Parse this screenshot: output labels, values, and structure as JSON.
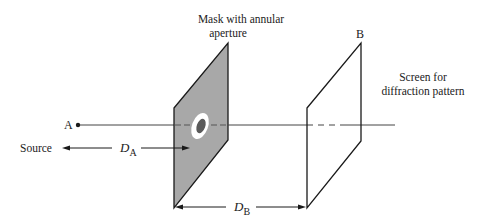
{
  "diagram": {
    "labels": {
      "mask_line1": "Mask with annular",
      "mask_line2": "aperture",
      "point_a": "A",
      "point_b": "B",
      "screen_line1": "Screen for",
      "screen_line2": "diffraction pattern",
      "source": "Source",
      "da_main": "D",
      "da_sub": "A",
      "db_main": "D",
      "db_sub": "B"
    },
    "colors": {
      "mask_fill": "#a8a8a8",
      "aperture_ring": "#ffffff",
      "aperture_core": "#5a5a5a",
      "line": "#1a1a1a",
      "axis": "#555555"
    }
  }
}
